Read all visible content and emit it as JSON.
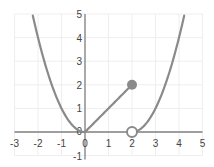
{
  "chart_data": {
    "type": "line",
    "title": "",
    "xlabel": "",
    "ylabel": "",
    "xlim": [
      -3,
      5
    ],
    "ylim": [
      -1,
      5
    ],
    "grid": true,
    "legend": null,
    "x_ticks": [
      "-3",
      "-2",
      "-1",
      "0",
      "1",
      "2",
      "3",
      "4",
      "5"
    ],
    "y_ticks": [
      "-1",
      "0",
      "1",
      "2",
      "3",
      "4",
      "5"
    ],
    "series": [
      {
        "name": "piece-1: y = x^2 (x <= 0)",
        "x": [
          -2.2,
          -2,
          -1.5,
          -1,
          -0.5,
          0
        ],
        "y": [
          4.84,
          4,
          2.25,
          1,
          0.25,
          0
        ]
      },
      {
        "name": "piece-2: y = x (0 <= x <= 2)",
        "x": [
          0,
          2
        ],
        "y": [
          0,
          2
        ]
      },
      {
        "name": "piece-3: y = (x-2)^2 (x > 2)",
        "x": [
          2,
          2.5,
          3,
          3.5,
          4,
          4.2
        ],
        "y": [
          0,
          0.25,
          1,
          2.25,
          4,
          4.84
        ]
      }
    ],
    "points": [
      {
        "x": 2,
        "y": 2,
        "style": "closed"
      },
      {
        "x": 2,
        "y": 0,
        "style": "open"
      }
    ],
    "colors": {
      "curve": "#8a8a8a",
      "axis": "#808080",
      "grid": "#eeeeee"
    }
  }
}
